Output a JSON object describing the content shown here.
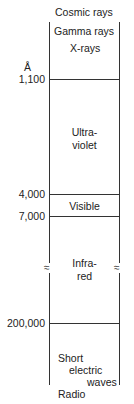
{
  "diagram": {
    "unit": "Å",
    "top_labels": [
      "Cosmic rays",
      "Gamma rays",
      "X-rays"
    ],
    "ticks": [
      {
        "value": "1,100",
        "y": 79
      },
      {
        "value": "4,000",
        "y": 194
      },
      {
        "value": "7,000",
        "y": 216
      },
      {
        "value": "200,000",
        "y": 323
      }
    ],
    "regions": [
      {
        "name": "ultraviolet",
        "line1": "Ultra-",
        "line2": "violet"
      },
      {
        "name": "visible",
        "line1": "Visible"
      },
      {
        "name": "infrared",
        "line1": "Infra-",
        "line2": "red"
      },
      {
        "name": "radio",
        "line1": "Short",
        "line2": "electric",
        "line3": "waves",
        "line4": "Radio"
      }
    ],
    "break_symbol": "≈"
  }
}
